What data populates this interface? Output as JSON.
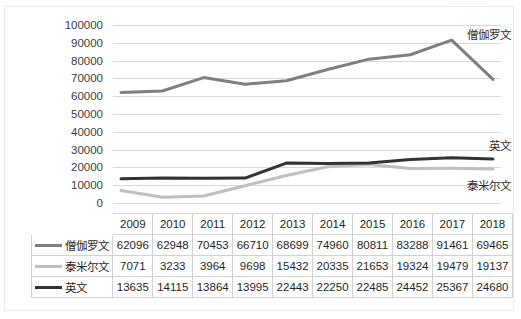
{
  "chart_data": {
    "type": "line",
    "title": "",
    "xlabel": "",
    "ylabel": "",
    "ylim": [
      0,
      100000
    ],
    "ytick_step": 10000,
    "yticks": [
      "100000",
      "90000",
      "80000",
      "70000",
      "60000",
      "50000",
      "40000",
      "30000",
      "20000",
      "10000",
      "0"
    ],
    "grid": true,
    "legend_position": "inline-right-of-series",
    "categories": [
      "2009",
      "2010",
      "2011",
      "2012",
      "2013",
      "2014",
      "2015",
      "2016",
      "2017",
      "2018"
    ],
    "series": [
      {
        "name": "僧伽罗文",
        "color": "#7f7f7f",
        "values": [
          62096,
          62948,
          70453,
          66710,
          68699,
          74960,
          80811,
          83288,
          91461,
          69465
        ]
      },
      {
        "name": "泰米尔文",
        "color": "#bfbfbf",
        "values": [
          7071,
          3233,
          3964,
          9698,
          15432,
          20335,
          21653,
          19324,
          19479,
          19137
        ]
      },
      {
        "name": "英文",
        "color": "#333333",
        "values": [
          13635,
          14115,
          13864,
          13995,
          22443,
          22250,
          22485,
          24452,
          25367,
          24680
        ]
      }
    ],
    "inline_annotations": [
      {
        "text": "僧伽罗文",
        "series": "僧伽罗文"
      },
      {
        "text": "英文",
        "series": "英文"
      },
      {
        "text": "泰米尔文",
        "series": "泰米尔文"
      }
    ]
  },
  "table": {
    "corner_label": "",
    "column_headers": [
      "2009",
      "2010",
      "2011",
      "2012",
      "2013",
      "2014",
      "2015",
      "2016",
      "2017",
      "2018"
    ],
    "rows": [
      {
        "label": "僧伽罗文",
        "swatch_color": "#7f7f7f",
        "cells": [
          "62096",
          "62948",
          "70453",
          "66710",
          "68699",
          "74960",
          "80811",
          "83288",
          "91461",
          "69465"
        ]
      },
      {
        "label": "泰米尔文",
        "swatch_color": "#bfbfbf",
        "cells": [
          "7071",
          "3233",
          "3964",
          "9698",
          "15432",
          "20335",
          "21653",
          "19324",
          "19479",
          "19137"
        ]
      },
      {
        "label": "英文",
        "swatch_color": "#333333",
        "cells": [
          "13635",
          "14115",
          "13864",
          "13995",
          "22443",
          "22250",
          "22485",
          "24452",
          "25367",
          "24680"
        ]
      }
    ]
  },
  "top_sliver": {
    "text": "· ···  · ··"
  }
}
